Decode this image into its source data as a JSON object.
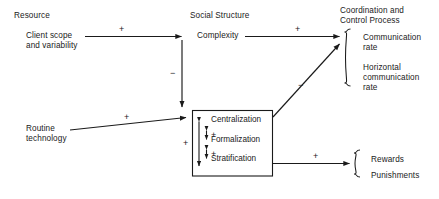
{
  "figure": {
    "type": "path-diagram",
    "background": "#ffffff",
    "line_color": "#1a1a1a"
  },
  "columns": [
    {
      "key": "resource",
      "heading": "Resource"
    },
    {
      "key": "social_structure",
      "heading": "Social Structure"
    },
    {
      "key": "coordination",
      "heading_line1": "Coordination and",
      "heading_line2": "Control Process"
    }
  ],
  "nodes": {
    "client_scope": {
      "line1": "Client scope",
      "line2": "and variability"
    },
    "routine_technology": {
      "line1": "Routine",
      "line2": "technology"
    },
    "complexity": {
      "label": "Complexity"
    },
    "structure_box": {
      "items": [
        {
          "label": "Centralization"
        },
        {
          "label": "Formalization"
        },
        {
          "label": "Stratification"
        }
      ],
      "inner_signs": [
        "+",
        "+"
      ],
      "outer_sign": "+"
    },
    "communication_group": {
      "items": [
        {
          "line1": "Communication",
          "line2": "rate"
        },
        {
          "line1": "Horizontal",
          "line2": "communication",
          "line3": "rate"
        }
      ]
    },
    "rewards_group": {
      "items": [
        {
          "label": "Rewards"
        },
        {
          "label": "Punishments"
        }
      ]
    }
  },
  "edges": [
    {
      "from": "client_scope",
      "to": "complexity",
      "sign": "+"
    },
    {
      "from": "complexity",
      "to": "structure_box",
      "sign": "−"
    },
    {
      "from": "routine_technology",
      "to": "structure_box",
      "sign": "+"
    },
    {
      "from": "complexity",
      "to": "communication_group",
      "sign": "+"
    },
    {
      "from": "structure_box",
      "to": "communication_group",
      "sign": "−"
    },
    {
      "from": "structure_box",
      "to": "rewards_group",
      "sign": "+"
    }
  ]
}
